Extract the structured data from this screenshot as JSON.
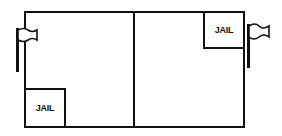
{
  "diagram": {
    "halves": [
      "left",
      "right"
    ],
    "jails": [
      {
        "side": "left",
        "position": "bottom-left",
        "label": "JAIL"
      },
      {
        "side": "right",
        "position": "top-right",
        "label": "JAIL"
      }
    ],
    "flags": [
      {
        "side": "left",
        "icon": "flag-icon"
      },
      {
        "side": "right",
        "icon": "flag-icon"
      }
    ],
    "colors": {
      "line": "#111111",
      "background": "#ffffff"
    }
  }
}
